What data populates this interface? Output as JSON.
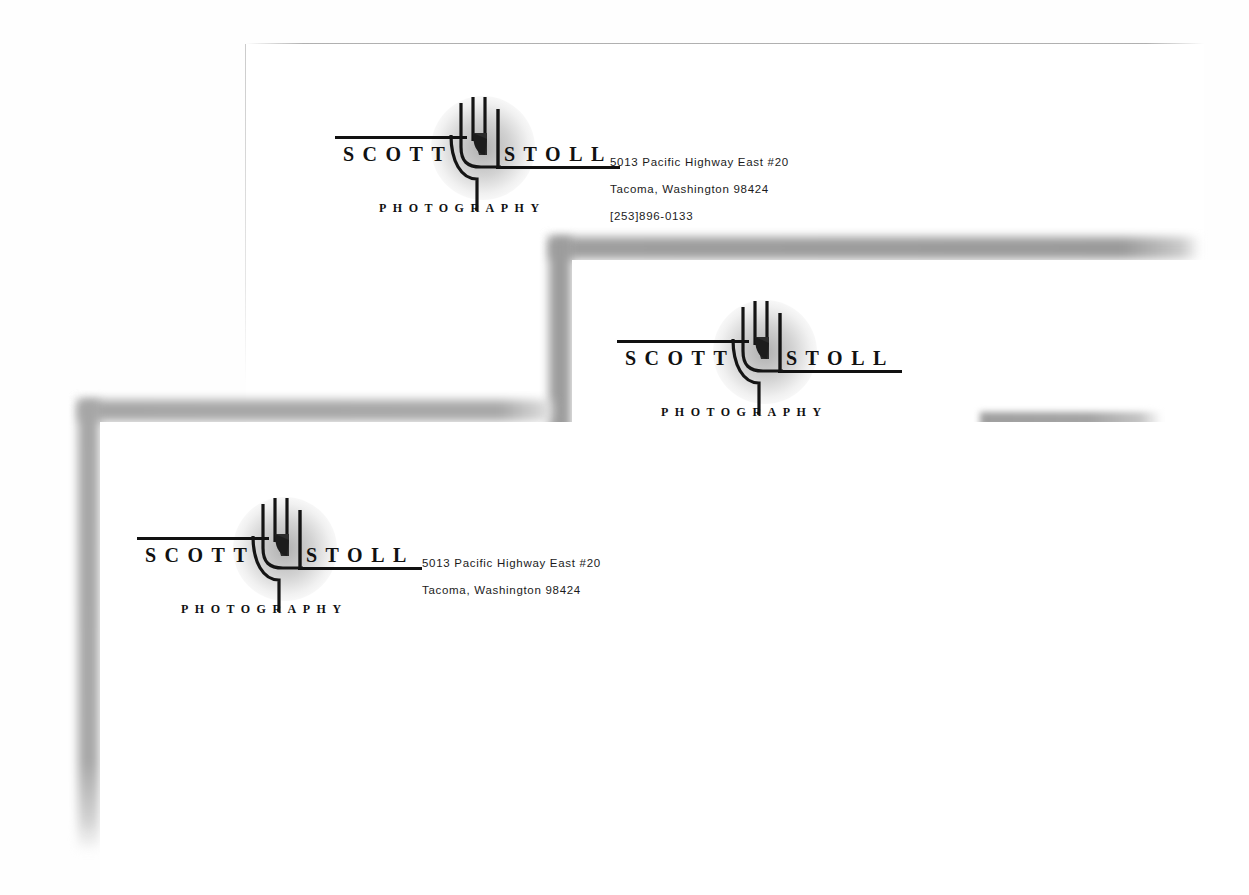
{
  "scene": {
    "background_color": "#ffffff",
    "description": "three overlapping white stationery sheets",
    "ink_color": "#111111",
    "shadow_color": "#9a9a9a"
  },
  "brand": {
    "first_name": "SCOTT",
    "last_name": "STOLL",
    "discipline": "PHOTOGRAPHY",
    "logo_icon": "hand-icon"
  },
  "contact": {
    "street": "5013 Pacific Highway East #20",
    "city_state_zip": "Tacoma, Washington 98424",
    "phone": "[253]896-0133"
  },
  "sheets": [
    {
      "id": "sheet-1",
      "name": "letterhead-top",
      "first_name": "SCOTT",
      "last_name": "STOLL",
      "discipline": "PHOTOGRAPHY",
      "address_lines": [
        "5013 Pacific Highway East #20",
        "Tacoma, Washington 98424",
        "[253]896-0133"
      ]
    },
    {
      "id": "sheet-2",
      "name": "letterhead-middle",
      "first_name": "SCOTT",
      "last_name": "STOLL",
      "discipline": "PHOTOGRAPHY",
      "address_lines": [
        "5013 Pacific Highway East #20",
        "Tacoma, Washington 98424",
        "[253]896-0133"
      ]
    },
    {
      "id": "sheet-3",
      "name": "letterhead-front",
      "first_name": "SCOTT",
      "last_name": "STOLL",
      "discipline": "PHOTOGRAPHY",
      "address_lines": [
        "5013 Pacific Highway East #20",
        "Tacoma, Washington 98424"
      ]
    }
  ]
}
